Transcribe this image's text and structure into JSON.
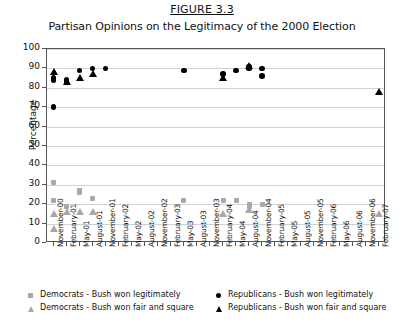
{
  "figure": {
    "number": "FIGURE 3.3",
    "title": "Partisan Opinions on the Legitimacy of the 2000 Election"
  },
  "colors": {
    "republican": "#000000",
    "democrat": "#a8a8a8",
    "gridline": "#d2d2d2",
    "axis": "#555555"
  },
  "legend": [
    {
      "label": "Democrats - Bush won legitimately",
      "marker": "square-marker",
      "color": "#a8a8a8"
    },
    {
      "label": "Republicans - Bush won legitimately",
      "marker": "circle-marker",
      "color": "#000000"
    },
    {
      "label": "Democrats - Bush won fair and square",
      "marker": "triangle-marker",
      "color": "#a8a8a8"
    },
    {
      "label": "Republicans - Bush won fair and square",
      "marker": "triangle-marker",
      "color": "#000000"
    }
  ],
  "source_note": "",
  "chart_data": {
    "type": "scatter",
    "title": "Partisan Opinions on the Legitimacy of the 2000 Election",
    "xlabel": "",
    "ylabel": "Percentage",
    "ylim": [
      0,
      100
    ],
    "ytick_step": 10,
    "ytick_labels": [
      "0",
      "10",
      "20",
      "30",
      "40",
      "50",
      "60",
      "70",
      "80",
      "90",
      "100"
    ],
    "grid": true,
    "legend_position": "below-axes",
    "categories": [
      "November-00",
      "February-01",
      "May-01",
      "August-01",
      "November-01",
      "February-02",
      "May-02",
      "August-02",
      "November-02",
      "February-03",
      "May-03",
      "August-03",
      "November-03",
      "February-04",
      "May-04",
      "August-04",
      "November-04",
      "February-05",
      "May-05",
      "August-05",
      "November-05",
      "February-06",
      "May-06",
      "August-06",
      "November-06",
      "February-07"
    ],
    "series": [
      {
        "name": "Republicans - Bush won legitimately",
        "marker": "circle",
        "color": "#000000",
        "points": [
          {
            "x": "November-00",
            "xi": 0,
            "y": 85
          },
          {
            "x": "November-00",
            "xi": 0,
            "y": 84
          },
          {
            "x": "November-00",
            "xi": 0,
            "y": 70
          },
          {
            "x": "February-01",
            "xi": 1,
            "y": 84
          },
          {
            "x": "February-01",
            "xi": 1,
            "y": 83
          },
          {
            "x": "May-01",
            "xi": 2,
            "y": 89
          },
          {
            "x": "August-01",
            "xi": 3,
            "y": 90
          },
          {
            "x": "November-01",
            "xi": 4,
            "y": 90
          },
          {
            "x": "May-03",
            "xi": 10,
            "y": 89
          },
          {
            "x": "February-04",
            "xi": 13,
            "y": 87
          },
          {
            "x": "May-04",
            "xi": 14,
            "y": 89
          },
          {
            "x": "August-04",
            "xi": 15,
            "y": 91
          },
          {
            "x": "August-04",
            "xi": 15,
            "y": 90
          },
          {
            "x": "November-04",
            "xi": 16,
            "y": 90
          },
          {
            "x": "November-04",
            "xi": 16,
            "y": 86
          }
        ]
      },
      {
        "name": "Republicans - Bush won fair and square",
        "marker": "triangle",
        "color": "#000000",
        "points": [
          {
            "x": "November-00",
            "xi": 0,
            "y": 88
          },
          {
            "x": "February-01",
            "xi": 1,
            "y": 83
          },
          {
            "x": "May-01",
            "xi": 2,
            "y": 85
          },
          {
            "x": "August-01",
            "xi": 3,
            "y": 87
          },
          {
            "x": "February-04",
            "xi": 13,
            "y": 85
          },
          {
            "x": "August-04",
            "xi": 15,
            "y": 91
          },
          {
            "x": "February-07",
            "xi": 25,
            "y": 78
          }
        ]
      },
      {
        "name": "Democrats - Bush won legitimately",
        "marker": "square",
        "color": "#a8a8a8",
        "points": [
          {
            "x": "November-00",
            "xi": 0,
            "y": 31
          },
          {
            "x": "November-00",
            "xi": 0,
            "y": 22
          },
          {
            "x": "February-01",
            "xi": 1,
            "y": 19
          },
          {
            "x": "May-01",
            "xi": 2,
            "y": 27
          },
          {
            "x": "May-01",
            "xi": 2,
            "y": 26
          },
          {
            "x": "August-01",
            "xi": 3,
            "y": 23
          },
          {
            "x": "May-03",
            "xi": 10,
            "y": 22
          },
          {
            "x": "February-04",
            "xi": 13,
            "y": 22
          },
          {
            "x": "May-04",
            "xi": 14,
            "y": 22
          },
          {
            "x": "August-04",
            "xi": 15,
            "y": 20
          },
          {
            "x": "August-04",
            "xi": 15,
            "y": 19
          },
          {
            "x": "November-04",
            "xi": 16,
            "y": 20
          }
        ]
      },
      {
        "name": "Democrats - Bush won fair and square",
        "marker": "triangle",
        "color": "#a8a8a8",
        "points": [
          {
            "x": "November-00",
            "xi": 0,
            "y": 15
          },
          {
            "x": "November-00",
            "xi": 0,
            "y": 7
          },
          {
            "x": "February-01",
            "xi": 1,
            "y": 16
          },
          {
            "x": "May-01",
            "xi": 2,
            "y": 16
          },
          {
            "x": "August-01",
            "xi": 3,
            "y": 16
          },
          {
            "x": "February-04",
            "xi": 13,
            "y": 15
          },
          {
            "x": "August-04",
            "xi": 15,
            "y": 17
          },
          {
            "x": "February-07",
            "xi": 25,
            "y": 15
          }
        ]
      }
    ]
  }
}
